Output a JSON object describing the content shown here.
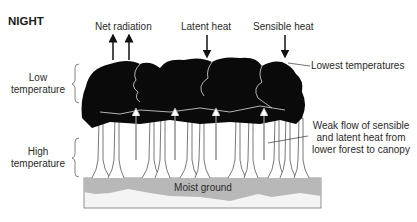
{
  "title": "NIGHT",
  "flux_labels": {
    "net_radiation": "Net radiation",
    "latent_heat": "Latent heat",
    "sensible_heat": "Sensible heat"
  },
  "zones": {
    "low": [
      "Low",
      "temperature"
    ],
    "high": [
      "High",
      "temperature"
    ]
  },
  "annotations": {
    "lowest_temperatures": "Lowest temperatures",
    "weak_flow": [
      "Weak flow of sensible",
      "and latent heat from",
      "lower forest to canopy"
    ]
  },
  "ground_label": "Moist ground",
  "colors": {
    "canopy": "#0a0a0a",
    "trunk_outline": "#555555",
    "ground_fill": "#b8b8b8",
    "ground_lower": "#f4f4f4",
    "arrow_black": "#111111",
    "arrow_grey": "#888888"
  }
}
